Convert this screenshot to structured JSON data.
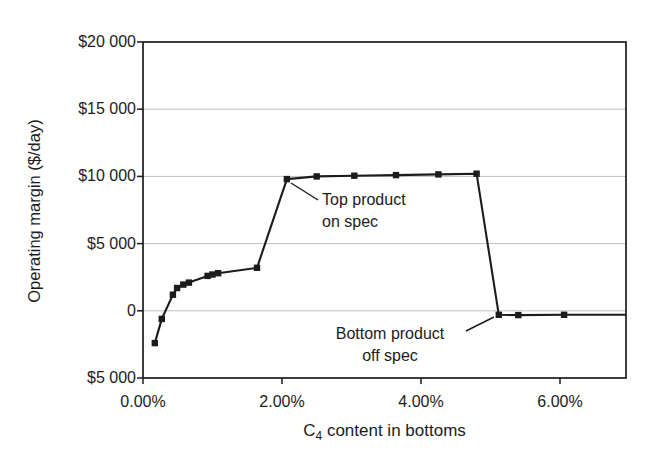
{
  "chart_data": {
    "type": "line",
    "title": "",
    "ylabel": "Operating margin ($/day)",
    "xlabel": {
      "pre": "C",
      "sub": "4",
      "post": " content in bottoms"
    },
    "xlim": [
      0,
      6.95
    ],
    "ylim": [
      -5000,
      20000
    ],
    "grid": "horizontal-only",
    "legend": "none",
    "x_ticks": [
      {
        "value": 0,
        "label": "0.00%"
      },
      {
        "value": 2,
        "label": "2.00%"
      },
      {
        "value": 4,
        "label": "4.00%"
      },
      {
        "value": 6,
        "label": "6.00%"
      }
    ],
    "y_ticks": [
      {
        "value": 20000,
        "label": "$20 000"
      },
      {
        "value": 15000,
        "label": "$15 000"
      },
      {
        "value": 10000,
        "label": "$10 000"
      },
      {
        "value": 5000,
        "label": "$5 000"
      },
      {
        "value": 0,
        "label": "0"
      },
      {
        "value": -5000,
        "label": "$5 000"
      }
    ],
    "gridline_values": [
      15000,
      10000,
      5000,
      0
    ],
    "colors": {
      "line": "#1c1c1c",
      "frame": "#1c1c1c",
      "grid": "#c0c0c0",
      "background": "#ffffff",
      "text": "#1c1c1c"
    },
    "series": [
      {
        "name": "Operating margin",
        "marker": "square",
        "color": "#1c1c1c",
        "points": [
          {
            "x": 0.17,
            "y": -2400
          },
          {
            "x": 0.27,
            "y": -600
          },
          {
            "x": 0.43,
            "y": 1200
          },
          {
            "x": 0.49,
            "y": 1700
          },
          {
            "x": 0.58,
            "y": 1950
          },
          {
            "x": 0.66,
            "y": 2100
          },
          {
            "x": 0.93,
            "y": 2600
          },
          {
            "x": 1.0,
            "y": 2700
          },
          {
            "x": 1.08,
            "y": 2800
          },
          {
            "x": 1.64,
            "y": 3200
          },
          {
            "x": 2.07,
            "y": 9800
          },
          {
            "x": 2.5,
            "y": 10000
          },
          {
            "x": 3.04,
            "y": 10050
          },
          {
            "x": 3.64,
            "y": 10100
          },
          {
            "x": 4.25,
            "y": 10150
          },
          {
            "x": 4.8,
            "y": 10200
          },
          {
            "x": 5.12,
            "y": -300
          },
          {
            "x": 5.4,
            "y": -320
          },
          {
            "x": 6.06,
            "y": -300
          }
        ],
        "line_end": {
          "x": 6.95,
          "y": -290
        }
      }
    ],
    "annotations": [
      {
        "name": "top-product-on-spec",
        "lines": [
          "Top product",
          "on spec"
        ],
        "align": "left",
        "text_x": 322,
        "text_y": 189,
        "leader": {
          "x1": 291,
          "y1": 183,
          "x2": 318,
          "y2": 200
        }
      },
      {
        "name": "bottom-product-off-spec",
        "lines": [
          "Bottom product",
          "off spec"
        ],
        "align": "center",
        "text_x": 390,
        "text_y": 323,
        "leader": {
          "x1": 466,
          "y1": 331,
          "x2": 494,
          "y2": 317
        }
      }
    ]
  }
}
